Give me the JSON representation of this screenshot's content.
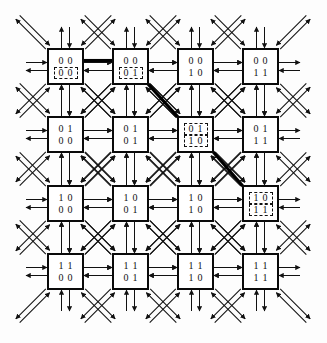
{
  "figure": {
    "kind": "network-topology-diagram",
    "topology": "4x4 two-dimensional torus mesh",
    "grid": {
      "rows": 4,
      "cols": 4
    },
    "node_label_format": "row-bits over column-bits (2 bits each, 4-bit address)",
    "directions_per_node": 8,
    "direction_names": [
      "north",
      "south",
      "east",
      "west",
      "northeast",
      "northwest",
      "southeast",
      "southwest"
    ],
    "link_style": "bidirectional double arrows",
    "colors": {
      "line": "#111111",
      "node_border": "#0a0a0a",
      "node_fill": "#ffffff",
      "background": "#fdfdfd",
      "highlight_path": "#000000",
      "marker_dash": "#111111"
    },
    "geometry": {
      "col_x": [
        47,
        112,
        177,
        242
      ],
      "row_y": [
        48,
        116,
        185,
        253
      ],
      "node_w": 37,
      "node_h": 37,
      "stub": 21,
      "lane": 4
    }
  },
  "nodes": [
    {
      "id": "n00",
      "row": 0,
      "col": 0,
      "top_bits": "0 0",
      "bottom_bits": "0 0",
      "top_marked": false,
      "bottom_marked": true
    },
    {
      "id": "n01",
      "row": 0,
      "col": 1,
      "top_bits": "0 0",
      "bottom_bits": "0 1",
      "top_marked": false,
      "bottom_marked": true
    },
    {
      "id": "n02",
      "row": 0,
      "col": 2,
      "top_bits": "0 0",
      "bottom_bits": "1 0",
      "top_marked": false,
      "bottom_marked": false
    },
    {
      "id": "n03",
      "row": 0,
      "col": 3,
      "top_bits": "0 0",
      "bottom_bits": "1 1",
      "top_marked": false,
      "bottom_marked": false
    },
    {
      "id": "n10",
      "row": 1,
      "col": 0,
      "top_bits": "0 1",
      "bottom_bits": "0 0",
      "top_marked": false,
      "bottom_marked": false
    },
    {
      "id": "n11",
      "row": 1,
      "col": 1,
      "top_bits": "0 1",
      "bottom_bits": "0 1",
      "top_marked": false,
      "bottom_marked": false
    },
    {
      "id": "n12",
      "row": 1,
      "col": 2,
      "top_bits": "0 1",
      "bottom_bits": "1 0",
      "top_marked": true,
      "bottom_marked": true
    },
    {
      "id": "n13",
      "row": 1,
      "col": 3,
      "top_bits": "0 1",
      "bottom_bits": "1 1",
      "top_marked": false,
      "bottom_marked": false
    },
    {
      "id": "n20",
      "row": 2,
      "col": 0,
      "top_bits": "1 0",
      "bottom_bits": "0 0",
      "top_marked": false,
      "bottom_marked": false
    },
    {
      "id": "n21",
      "row": 2,
      "col": 1,
      "top_bits": "1 0",
      "bottom_bits": "0 1",
      "top_marked": false,
      "bottom_marked": false
    },
    {
      "id": "n22",
      "row": 2,
      "col": 2,
      "top_bits": "1 0",
      "bottom_bits": "1 0",
      "top_marked": false,
      "bottom_marked": false
    },
    {
      "id": "n23",
      "row": 2,
      "col": 3,
      "top_bits": "1 0",
      "bottom_bits": "1 1",
      "top_marked": true,
      "bottom_marked": true
    },
    {
      "id": "n30",
      "row": 3,
      "col": 0,
      "top_bits": "1 1",
      "bottom_bits": "0 0",
      "top_marked": false,
      "bottom_marked": false
    },
    {
      "id": "n31",
      "row": 3,
      "col": 1,
      "top_bits": "1 1",
      "bottom_bits": "0 1",
      "top_marked": false,
      "bottom_marked": false
    },
    {
      "id": "n32",
      "row": 3,
      "col": 2,
      "top_bits": "1 1",
      "bottom_bits": "1 0",
      "top_marked": false,
      "bottom_marked": false
    },
    {
      "id": "n33",
      "row": 3,
      "col": 3,
      "top_bits": "1 1",
      "bottom_bits": "1 1",
      "top_marked": false,
      "bottom_marked": false
    }
  ],
  "highlighted_path": {
    "description": "thick traced route through the mesh",
    "hops": [
      {
        "from": "n00",
        "to": "n01",
        "direction": "east"
      },
      {
        "from": "n01",
        "to": "n12",
        "direction": "southeast"
      },
      {
        "from": "n12",
        "to": "n23",
        "direction": "southeast"
      }
    ]
  }
}
